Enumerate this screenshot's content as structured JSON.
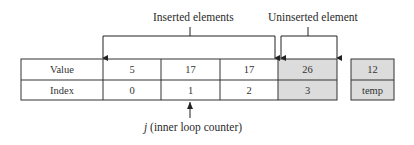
{
  "annotations": {
    "inserted": "Inserted elements",
    "uninserted": "Uninserted element",
    "pointer_var": "j",
    "pointer_desc": " (inner loop counter)"
  },
  "table": {
    "row_labels": [
      "Value",
      "Index"
    ],
    "columns": [
      {
        "value": "5",
        "index": "0",
        "state": "inserted"
      },
      {
        "value": "17",
        "index": "1",
        "state": "inserted"
      },
      {
        "value": "17",
        "index": "2",
        "state": "inserted"
      },
      {
        "value": "26",
        "index": "3",
        "state": "uninserted"
      }
    ]
  },
  "temp": {
    "value": "12",
    "label": "temp"
  },
  "colors": {
    "border": "#333333",
    "shaded": "#dcdcdc",
    "background": "#ffffff"
  }
}
